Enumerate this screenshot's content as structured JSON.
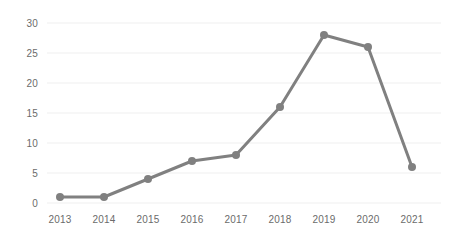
{
  "chart_data": {
    "type": "line",
    "title": "",
    "subtitle": "",
    "xlabel": "",
    "ylabel": "",
    "categories": [
      "2013",
      "2014",
      "2015",
      "2016",
      "2017",
      "2018",
      "2019",
      "2020",
      "2021"
    ],
    "values": [
      1,
      1,
      4,
      7,
      8,
      16,
      28,
      26,
      6
    ],
    "series": [
      {
        "name": "",
        "values": [
          1,
          1,
          4,
          7,
          8,
          16,
          28,
          26,
          6
        ]
      }
    ],
    "ylim": [
      0,
      30
    ],
    "y_ticks": [
      "0",
      "5",
      "10",
      "15",
      "20",
      "25",
      "30"
    ],
    "y_tick_values": [
      0,
      5,
      10,
      15,
      20,
      25,
      30
    ],
    "x_ticks": [
      "2013",
      "2014",
      "2015",
      "2016",
      "2017",
      "2018",
      "2019",
      "2020",
      "2021"
    ],
    "grid": true,
    "grid_axis": "y",
    "legend": false,
    "legend_position": "none",
    "markers": true,
    "colors": {
      "line": "#808080",
      "marker": "#808080",
      "grid": "#f4f4f4",
      "tick_text": "#6b6b6b",
      "background": "#ffffff"
    },
    "line_width": 3,
    "marker_radius": 4
  }
}
